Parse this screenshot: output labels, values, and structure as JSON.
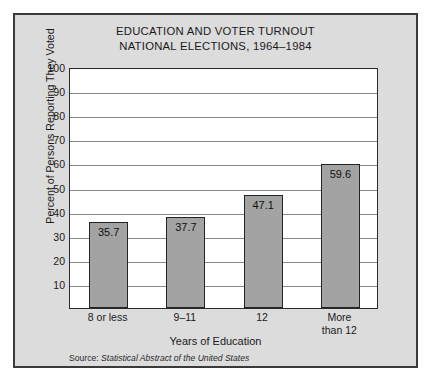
{
  "figure": {
    "title_line1": "EDUCATION AND VOTER TURNOUT",
    "title_line2": "NATIONAL ELECTIONS, 1964–1984",
    "source_prefix": "Source: ",
    "source_work": "Statistical Abstract of the United States",
    "frame_color": "#3a3a3a",
    "panel_color": "#dcdcdc",
    "plot_background": "#ffffff",
    "bar_fill": "#a3a3a3",
    "bar_edge": "#232323",
    "grid_color": "#8a8a8a"
  },
  "chart_data": {
    "type": "bar",
    "title": "EDUCATION AND VOTER TURNOUT NATIONAL ELECTIONS, 1964–1984",
    "subtitle": "NATIONAL ELECTIONS, 1964–1984",
    "xlabel": "Years of Education",
    "ylabel": "Percent of Persons Reporting They Voted",
    "categories": [
      "8 or less",
      "9–11",
      "12",
      "More than 12"
    ],
    "category_lines": [
      [
        "8 or less"
      ],
      [
        "9–11"
      ],
      [
        "12"
      ],
      [
        "More",
        "than 12"
      ]
    ],
    "values": [
      35.7,
      37.7,
      47.1,
      59.6
    ],
    "value_labels": [
      "35.7",
      "37.7",
      "47.1",
      "59.6"
    ],
    "ylim": [
      0,
      100
    ],
    "yticks": [
      100,
      90,
      80,
      70,
      60,
      50,
      40,
      30,
      20,
      10
    ],
    "ytick_labels": [
      "100",
      "90",
      "80",
      "70",
      "60",
      "50",
      "40",
      "30",
      "20",
      "10"
    ],
    "grid": "horizontal",
    "legend": "none",
    "annotation": "Source: Statistical Abstract of the United States"
  }
}
